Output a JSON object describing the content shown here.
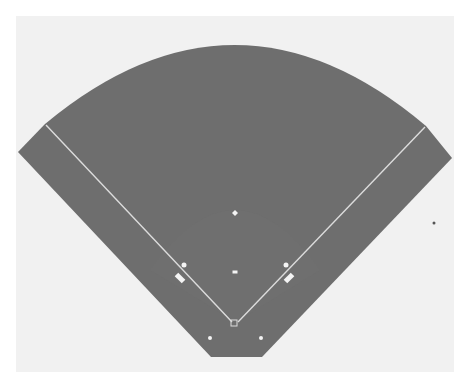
{
  "diagram": {
    "type": "baseball-field",
    "title": "",
    "colors": {
      "page": "#ffffff",
      "paper": "#f1f1f1",
      "field": "#6e6e6e",
      "infield_shade": "#707070",
      "lines": "#dcdcdc",
      "markers": "#f4f4f4",
      "stray_dot": "#555555"
    },
    "paper": {
      "x": 16,
      "y": 16,
      "w": 438,
      "h": 356
    },
    "field_outline": {
      "arc_left": [
        45,
        124
      ],
      "arc_top": [
        236,
        48
      ],
      "arc_right": [
        426,
        126
      ],
      "left_point": [
        18,
        152
      ],
      "right_point": [
        452,
        158
      ],
      "bottom_left": [
        211,
        357
      ],
      "bottom_right": [
        262,
        357
      ]
    },
    "foul_lines": [
      {
        "name": "third-base-line",
        "from": [
          46,
          125
        ],
        "to": [
          232,
          322
        ]
      },
      {
        "name": "first-base-line",
        "from": [
          425,
          127
        ],
        "to": [
          238,
          322
        ]
      }
    ],
    "markers": [
      {
        "name": "second-base",
        "shape": "diamond",
        "x": 235,
        "y": 213,
        "size": 6
      },
      {
        "name": "third-base",
        "shape": "dot",
        "x": 184,
        "y": 265,
        "size": 5
      },
      {
        "name": "first-base",
        "shape": "dot",
        "x": 286,
        "y": 265,
        "size": 5
      },
      {
        "name": "pitcher-rubber",
        "shape": "rect",
        "x": 235,
        "y": 272,
        "w": 5,
        "h": 3,
        "rotate": 0
      },
      {
        "name": "third-base-coach-box",
        "shape": "rect",
        "x": 180,
        "y": 278,
        "w": 10,
        "h": 5,
        "rotate": 45
      },
      {
        "name": "first-base-coach-box",
        "shape": "rect",
        "x": 289,
        "y": 278,
        "w": 10,
        "h": 5,
        "rotate": -45
      },
      {
        "name": "home-plate",
        "shape": "plate",
        "x": 234,
        "y": 323,
        "size": 6
      },
      {
        "name": "left-on-deck-circle",
        "shape": "dot",
        "x": 210,
        "y": 338,
        "size": 4
      },
      {
        "name": "right-on-deck-circle",
        "shape": "dot",
        "x": 261,
        "y": 338,
        "size": 4
      }
    ],
    "stray_dot": {
      "x": 434,
      "y": 223,
      "r": 1.5
    }
  }
}
